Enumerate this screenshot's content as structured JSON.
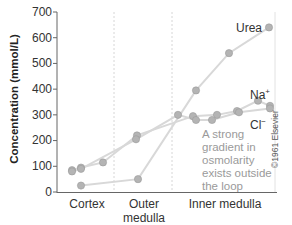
{
  "chart_data": {
    "type": "line",
    "title": "",
    "xlabel": "",
    "ylabel": "Concentration (mmol/L)",
    "ylim": [
      0,
      700
    ],
    "yticks": [
      0,
      100,
      200,
      300,
      400,
      500,
      600,
      700
    ],
    "grid": false,
    "x_regions": [
      "Cortex",
      "Outer medulla",
      "Inner medulla"
    ],
    "legend": "inline labels",
    "series": [
      {
        "name": "Urea",
        "points": [
          [
            81,
            25
          ],
          [
            138,
            50
          ],
          [
            196,
            395
          ],
          [
            229,
            540
          ],
          [
            269,
            640
          ]
        ]
      },
      {
        "name": "Na+",
        "points": [
          [
            72,
            85
          ],
          [
            81,
            95
          ],
          [
            103,
            115
          ],
          [
            137,
            220
          ],
          [
            193,
            295
          ],
          [
            217,
            300
          ],
          [
            237,
            315
          ],
          [
            258,
            355
          ],
          [
            270,
            335
          ]
        ]
      },
      {
        "name": "Cl-",
        "points": [
          [
            72,
            80
          ],
          [
            81,
            90
          ],
          [
            136,
            205
          ],
          [
            178,
            300
          ],
          [
            196,
            280
          ],
          [
            212,
            280
          ],
          [
            239,
            310
          ],
          [
            270,
            325
          ]
        ]
      }
    ],
    "annotation": "A strong gradient in osmolarity exists outside the loop",
    "credit": "©1961 Elsevier"
  },
  "axis": {
    "ylabel": "Concentration (mmol/L)",
    "ticks": [
      "700",
      "600",
      "500",
      "400",
      "300",
      "200",
      "100",
      "0"
    ]
  },
  "regions": {
    "cortex": "Cortex",
    "outer_line1": "Outer",
    "outer_line2": "medulla",
    "inner": "Inner medulla"
  },
  "labels": {
    "urea": "Urea",
    "na": "Na",
    "na_sup": "+",
    "cl": "Cl",
    "cl_sup": "−"
  },
  "note": "A strong gradient in osmolarity exists outside the loop",
  "copyright": "©1961 Elsevier",
  "colors": {
    "line": "#d8d8d8",
    "marker": "#b4b4b4",
    "marker_stroke": "#9a9a9a",
    "axis": "#666666",
    "divider": "#d0d0d0"
  }
}
